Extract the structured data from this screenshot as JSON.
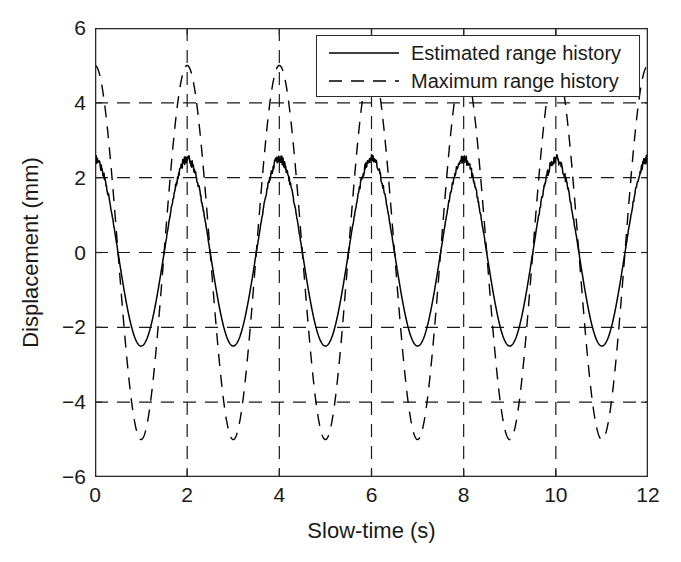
{
  "chart_data": {
    "type": "line",
    "title": "",
    "xlabel": "Slow-time (s)",
    "ylabel": "Displacement (mm)",
    "xlim": [
      0,
      12
    ],
    "ylim": [
      -6,
      6
    ],
    "xticks": [
      0,
      2,
      4,
      6,
      8,
      10,
      12
    ],
    "xtick_labels": [
      "0",
      "2",
      "4",
      "6",
      "8",
      "10",
      "12"
    ],
    "yticks": [
      -6,
      -4,
      -2,
      0,
      2,
      4,
      6
    ],
    "ytick_labels": [
      "−6",
      "−4",
      "−2",
      "0",
      "2",
      "4",
      "6"
    ],
    "grid": true,
    "grid_style": "dashed",
    "grid_x_values": [
      2,
      4,
      6,
      8,
      10
    ],
    "grid_y_values": [
      -4,
      -2,
      0,
      2,
      4
    ],
    "legend_position": "top-right",
    "series": [
      {
        "name": "Estimated range history",
        "style": "solid",
        "color": "#000000",
        "period_s": 2,
        "amplitude_mm": 2.5,
        "phase": "cosine",
        "noisy": true,
        "noise_amplitude_mm": 0.12,
        "peaks_at": [
          0,
          2,
          4,
          6,
          8,
          10,
          12
        ],
        "troughs_at": [
          1,
          3,
          5,
          7,
          9,
          11
        ],
        "peak_value_mm": 2.5,
        "trough_value_mm": -2.5
      },
      {
        "name": "Maximum range history",
        "style": "dashed",
        "color": "#000000",
        "period_s": 2,
        "amplitude_mm": 5.0,
        "phase": "cosine",
        "noisy": false,
        "peaks_at": [
          0,
          2,
          4,
          6,
          8,
          10,
          12
        ],
        "troughs_at": [
          1,
          3,
          5,
          7,
          9,
          11
        ],
        "peak_value_mm": 5.0,
        "trough_value_mm": -5.0
      }
    ]
  },
  "legend": {
    "items": [
      {
        "label": "Estimated range history",
        "style": "solid"
      },
      {
        "label": "Maximum range history",
        "style": "dashed"
      }
    ]
  },
  "axes": {
    "xlabel": "Slow-time (s)",
    "ylabel": "Displacement (mm)"
  }
}
